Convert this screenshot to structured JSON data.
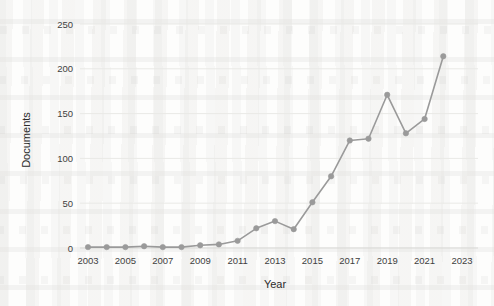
{
  "chart_data": {
    "type": "line",
    "title": "",
    "xlabel": "Year",
    "ylabel": "Documents",
    "x": [
      2003,
      2004,
      2005,
      2006,
      2007,
      2008,
      2009,
      2010,
      2011,
      2012,
      2013,
      2014,
      2015,
      2016,
      2017,
      2018,
      2019,
      2020,
      2021,
      2022
    ],
    "values": [
      1,
      1,
      1,
      2,
      1,
      1,
      3,
      4,
      8,
      22,
      30,
      21,
      51,
      80,
      120,
      122,
      171,
      128,
      144,
      214
    ],
    "series": [
      {
        "name": "Documents",
        "values": [
          1,
          1,
          1,
          2,
          1,
          1,
          3,
          4,
          8,
          22,
          30,
          21,
          51,
          80,
          120,
          122,
          171,
          128,
          144,
          214
        ]
      }
    ],
    "xlim": [
      2002.5,
      2023.5
    ],
    "ylim": [
      0,
      260
    ],
    "x_ticks": [
      2003,
      2005,
      2007,
      2009,
      2011,
      2013,
      2015,
      2017,
      2019,
      2021,
      2023
    ],
    "x_tick_labels": [
      "2003",
      "2005",
      "2007",
      "2009",
      "2011",
      "2013",
      "2015",
      "2017",
      "2019",
      "2021",
      "2023"
    ],
    "y_ticks": [
      0,
      50,
      100,
      150,
      200,
      250
    ],
    "y_tick_labels": [
      "0",
      "50",
      "100",
      "150",
      "200",
      "250"
    ],
    "grid": "horizontal",
    "legend": "none",
    "marker": "circle",
    "line_color": "#9a9a9a",
    "marker_color": "#9a9a9a",
    "grid_color": "#e9e9e6",
    "text_color": "#3f3f3f",
    "background_color": "#fdfdfc"
  }
}
